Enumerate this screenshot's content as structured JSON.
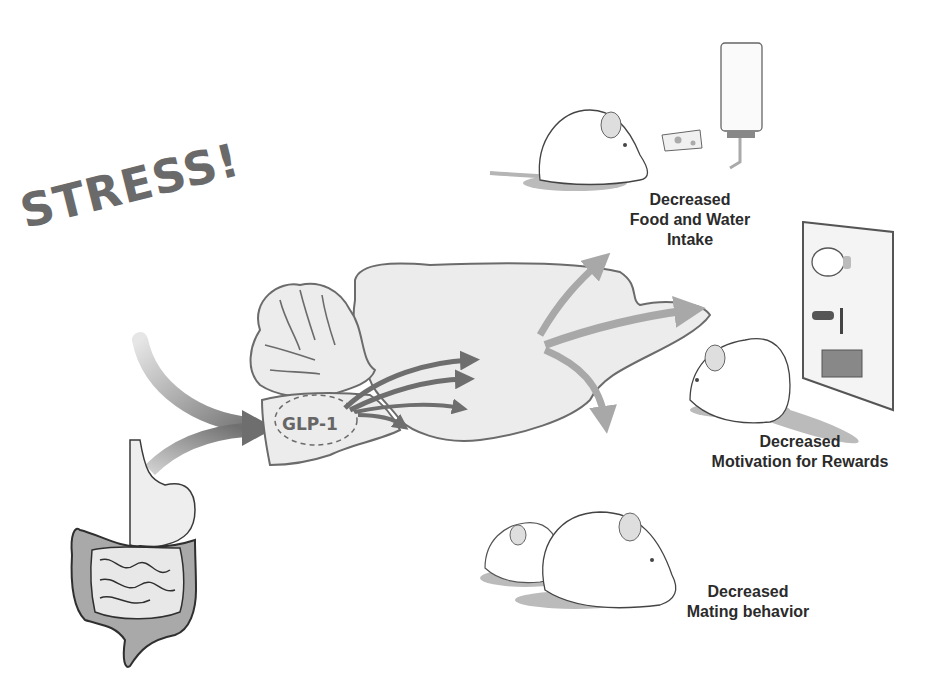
{
  "figure": {
    "stress_label": "STRESS!",
    "hormone_label": "GLP-1",
    "outcomes": [
      {
        "line1": "Decreased",
        "line2": "Food and Water",
        "line3": "Intake"
      },
      {
        "line1": "Decreased",
        "line2": "Motivation for Rewards"
      },
      {
        "line1": "Decreased",
        "line2": "Mating behavior"
      }
    ]
  },
  "colors": {
    "outline": "#6b6b6b",
    "brain_fill": "#ececec",
    "arrow_dark": "#6e6e6e",
    "arrow_light": "#a8a8a8",
    "text": "#2b2b2b",
    "gut_fill": "#a9a9a9"
  }
}
